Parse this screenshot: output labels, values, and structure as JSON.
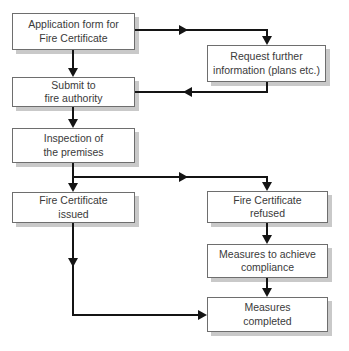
{
  "colors": {
    "background": "#ffffff",
    "box_fill": "#ffffff",
    "box_border": "#6e6e6e",
    "box_shadow": "#c9c9c9",
    "text": "#3a3a3a",
    "connector": "#141414"
  },
  "diagram": {
    "type": "flowchart",
    "title": "",
    "nodes": [
      {
        "id": "application-form",
        "line1": "Application form for",
        "line2": "Fire Certificate"
      },
      {
        "id": "request-further-info",
        "line1": "Request further",
        "line2": "information (plans etc.)"
      },
      {
        "id": "submit-fire-authority",
        "line1": "Submit to",
        "line2": "fire authority"
      },
      {
        "id": "inspection-premises",
        "line1": "Inspection of",
        "line2": "the premises"
      },
      {
        "id": "certificate-issued",
        "line1": "Fire Certificate",
        "line2": "issued"
      },
      {
        "id": "certificate-refused",
        "line1": "Fire Certificate",
        "line2": "refused"
      },
      {
        "id": "measures-compliance",
        "line1": "Measures to achieve",
        "line2": "compliance"
      },
      {
        "id": "measures-completed",
        "line1": "Measures",
        "line2": "completed"
      }
    ],
    "edges": [
      {
        "from": "application-form",
        "to": "submit-fire-authority"
      },
      {
        "from": "application-form",
        "to": "request-further-info"
      },
      {
        "from": "request-further-info",
        "to": "submit-fire-authority"
      },
      {
        "from": "submit-fire-authority",
        "to": "inspection-premises"
      },
      {
        "from": "inspection-premises",
        "to": "certificate-issued"
      },
      {
        "from": "inspection-premises",
        "to": "certificate-refused"
      },
      {
        "from": "certificate-refused",
        "to": "measures-compliance"
      },
      {
        "from": "measures-compliance",
        "to": "measures-completed"
      },
      {
        "from": "certificate-issued",
        "to": "measures-completed"
      }
    ]
  }
}
